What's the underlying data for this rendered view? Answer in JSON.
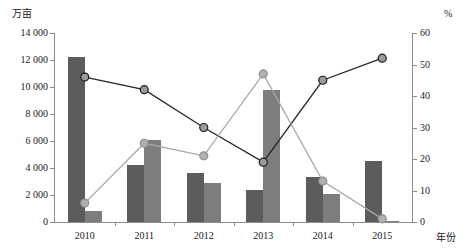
{
  "chart_data": {
    "type": "bar",
    "title": "",
    "subtitle": "",
    "xlabel": "年份",
    "ylabel": "万亩",
    "ylabel_right": "%",
    "categories": [
      "2010",
      "2011",
      "2012",
      "2013",
      "2014",
      "2015"
    ],
    "ylim": [
      0,
      14000
    ],
    "ylim_right": [
      0,
      60
    ],
    "ytick_labels": [
      "0",
      "2 000",
      "4 000",
      "6 000",
      "8 000",
      "10 000",
      "12 000",
      "14 000"
    ],
    "ytick_values": [
      0,
      2000,
      4000,
      6000,
      8000,
      10000,
      12000,
      14000
    ],
    "ytick_labels_right": [
      "0",
      "10",
      "20",
      "30",
      "40",
      "50",
      "60"
    ],
    "ytick_values_right": [
      0,
      10,
      20,
      30,
      40,
      50,
      60
    ],
    "grid": false,
    "legend_position": "none",
    "series": [
      {
        "name": "bar-series-1",
        "kind": "bar",
        "axis": "left",
        "color": "#5c5c5c",
        "values": [
          12200,
          4200,
          3600,
          2400,
          3300,
          4500
        ]
      },
      {
        "name": "bar-series-2",
        "kind": "bar",
        "axis": "left",
        "color": "#7d7d7d",
        "values": [
          800,
          6100,
          2900,
          9800,
          2100,
          100
        ]
      },
      {
        "name": "line-series-dark",
        "kind": "line",
        "axis": "right",
        "color": "#262626",
        "marker": "circle",
        "values": [
          46,
          42,
          30,
          19,
          45,
          52
        ]
      },
      {
        "name": "line-series-light",
        "kind": "line",
        "axis": "right",
        "color": "#a8a8a8",
        "marker": "circle",
        "values": [
          6,
          25,
          21,
          47,
          13,
          1
        ]
      }
    ]
  }
}
